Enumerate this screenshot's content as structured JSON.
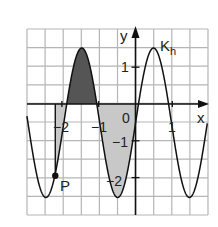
{
  "chart_data": {
    "type": "line",
    "title": "",
    "curve_label": "K",
    "curve_label_sub": "h",
    "xlabel": "x",
    "ylabel": "y",
    "origin_label": "0",
    "x_ticks": [
      {
        "value": -2,
        "label": "−2"
      },
      {
        "value": -1,
        "label": "−1"
      },
      {
        "value": 1,
        "label": "1"
      }
    ],
    "y_ticks": [
      {
        "value": 1,
        "label": "1"
      },
      {
        "value": -1,
        "label": "−1"
      },
      {
        "value": -2,
        "label": "−2"
      }
    ],
    "xlim": [
      -2.95,
      1.95
    ],
    "ylim": [
      -3.0,
      2.03
    ],
    "grid": true,
    "grid_step": 0.5,
    "function": {
      "amplitude": 2.03,
      "offset": -0.51,
      "period": 1.95,
      "phase_max_x": -1.46
    },
    "maxima": [
      {
        "x": -1.46,
        "y": 1.5
      },
      {
        "x": 0.49,
        "y": 1.5
      }
    ],
    "minima": [
      {
        "x": -2.43,
        "y": -2.5
      },
      {
        "x": -0.47,
        "y": -2.5
      },
      {
        "x": 1.49,
        "y": -2.5
      }
    ],
    "point": {
      "label": "P",
      "x": -2.18,
      "y": -1.95
    },
    "vertical_line_x": -2.18,
    "shaded_regions": [
      {
        "name": "above-axis",
        "from": -1.86,
        "to": -1.03,
        "color": "#555555"
      },
      {
        "name": "below-axis-left",
        "from": -2.18,
        "to": -1.86,
        "color": "#c8c8c8"
      },
      {
        "name": "below-axis-right",
        "from": -1.03,
        "to": 0.08,
        "color": "#c8c8c8"
      }
    ]
  },
  "colors": {
    "grid": "#b5b5b5",
    "axis": "#111111",
    "curve": "#111111",
    "dark_fill": "#555555",
    "light_fill": "#c8c8c8"
  }
}
